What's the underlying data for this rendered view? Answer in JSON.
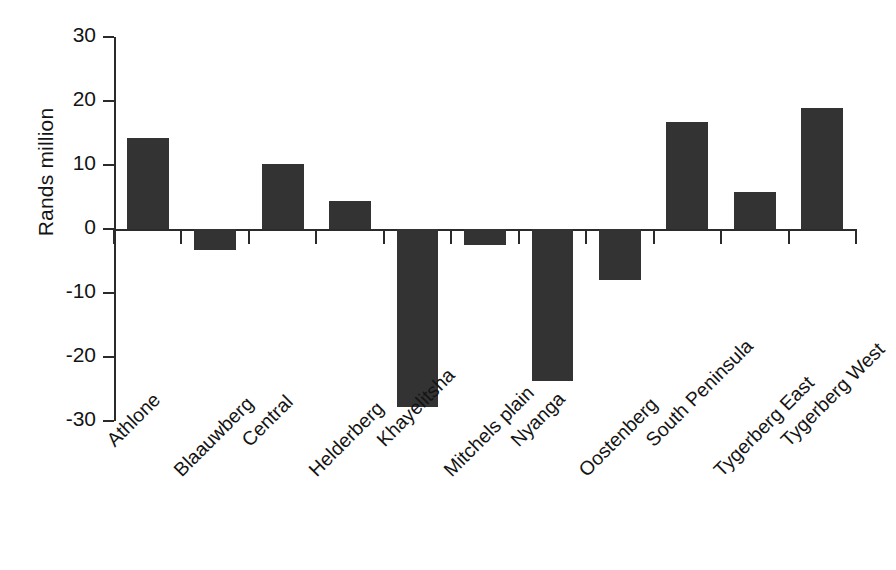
{
  "chart_data": {
    "type": "bar",
    "title": "",
    "subtitle": "",
    "xlabel": "",
    "ylabel": "Rands million",
    "ylim": [
      -30,
      30
    ],
    "ytick_values": [
      30,
      20,
      10,
      0,
      -10,
      -20,
      -30
    ],
    "ytick_labels": [
      "30",
      "20",
      "10",
      "0",
      "-10",
      "-20",
      "-30"
    ],
    "grid": false,
    "legend": false,
    "legend_position": "none",
    "bar_color": "#333333",
    "axis_color": "#2b2b2b",
    "categories": [
      "Athlone",
      "Blaauwberg",
      "Central",
      "Helderberg",
      "Khayelitsha",
      "Mitchels plain",
      "Nyanga",
      "Oostenberg",
      "South Peninsula",
      "Tygerberg East",
      "Tygerberg West"
    ],
    "values": [
      14.2,
      -3.3,
      10.2,
      4.4,
      -27.8,
      -2.5,
      -23.7,
      -8.0,
      16.7,
      5.8,
      18.9
    ]
  }
}
